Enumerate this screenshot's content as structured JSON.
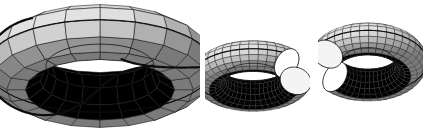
{
  "figure": {
    "background_color": "#ffffff",
    "width": 425,
    "height": 137,
    "panel_count": 3,
    "panels": [
      {
        "name": "uncut-torus-with-curve",
        "label": "torus with cutting curve",
        "kind": "torus",
        "mesh_u": 20,
        "mesh_v": 10,
        "show_curve": true,
        "curve_color": "#0d0d0d",
        "curve_width": 2.2,
        "edge_color": "#1a1a1a",
        "edge_width": 0.55,
        "center_x": 100,
        "center_y": 66,
        "major_radius": 84,
        "minor_radius": 30,
        "tilt_deg": 64,
        "spin_deg": 0,
        "squash": 0.42
      },
      {
        "name": "cut-half-torus-front",
        "label": "left half piece",
        "kind": "half-torus",
        "mesh_u": 34,
        "mesh_v": 16,
        "show_curve": false,
        "edge_color": "#2a2a2a",
        "edge_width": 0.4,
        "center_x": 48,
        "center_y": 46,
        "major_radius": 44,
        "minor_radius": 16,
        "tilt_deg": 62,
        "spin_deg": 12,
        "squash": 0.44,
        "u_start_deg": 28,
        "u_sweep_deg": 306
      },
      {
        "name": "cut-half-torus-back",
        "label": "right half piece",
        "kind": "half-torus",
        "mesh_u": 34,
        "mesh_v": 16,
        "show_curve": false,
        "edge_color": "#2a2a2a",
        "edge_width": 0.4,
        "center_x": 50,
        "center_y": 46,
        "major_radius": 43,
        "minor_radius": 16,
        "tilt_deg": 58,
        "spin_deg": 200,
        "squash": 0.46,
        "u_start_deg": 20,
        "u_sweep_deg": 300
      }
    ],
    "shading": {
      "model": "lambert-grayscale",
      "light_dir": [
        -0.35,
        -0.72,
        0.6
      ],
      "ambient": 0.3,
      "diffuse": 0.78,
      "gamma": 1.0,
      "min_gray": "#4a4a4a",
      "mid_gray": "#9a9a9a",
      "max_gray": "#e2e2e2",
      "inner_wall_gray": "#3c3c3c",
      "hole_fill": "#ffffff"
    },
    "curve": {
      "type": "torus-knot-curve",
      "p": 1,
      "q": 2,
      "samples": 420,
      "description": "closed curve winding once the long way and twice the short way"
    },
    "colors": {
      "background": "#ffffff",
      "outline": "#0d0d0d",
      "mesh_line": "#1f1f1f"
    }
  }
}
